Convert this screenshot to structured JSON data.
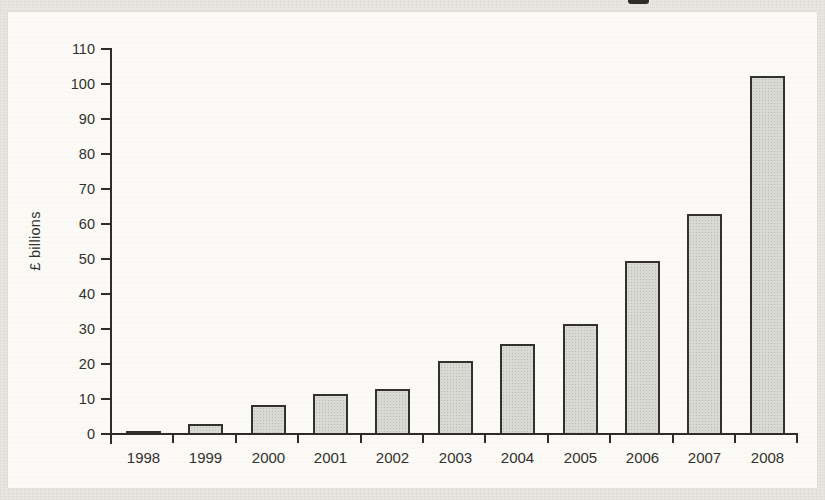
{
  "figure": {
    "ylabel": "£ billions"
  },
  "chart_data": {
    "type": "bar",
    "title": "",
    "xlabel": "",
    "ylabel": "£ billions",
    "categories": [
      "1998",
      "1999",
      "2000",
      "2001",
      "2002",
      "2003",
      "2004",
      "2005",
      "2006",
      "2007",
      "2008"
    ],
    "values": [
      0.5,
      2.5,
      8,
      11,
      12.5,
      20.5,
      25.5,
      31,
      49,
      62.5,
      102
    ],
    "ylim": [
      0,
      110
    ],
    "ytick_step": 10,
    "ytick_labels": [
      "0",
      "10",
      "20",
      "30",
      "40",
      "50",
      "60",
      "70",
      "80",
      "90",
      "100",
      "110"
    ],
    "grid": false,
    "legend": false,
    "bar_fill": "#dadad5",
    "bar_border": "#33312d",
    "axis_color": "#2f2d29",
    "text_color": "#33312d",
    "panel_color": "#fbfaf6",
    "frame_color": "#e8e6e0"
  }
}
